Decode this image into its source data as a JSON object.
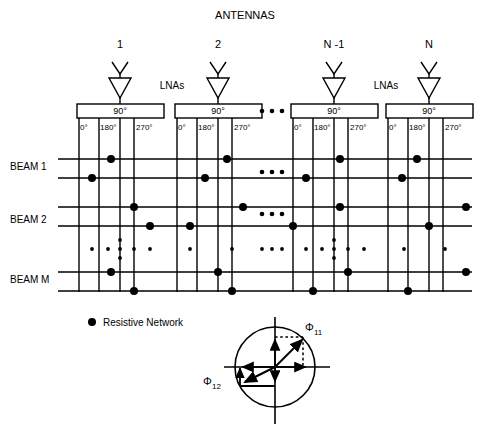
{
  "diagram": {
    "title": "ANTENNAS",
    "amplifier_label": "LNAs",
    "hybrid_label": "90°",
    "antenna_labels": [
      "1",
      "2",
      "N -1",
      "N"
    ],
    "port_labels": [
      "0°",
      "180°",
      "270°"
    ],
    "beam_labels": [
      "BEAM 1",
      "BEAM 2",
      "BEAM M"
    ],
    "legend": {
      "marker": "●",
      "text": "Resistive Network"
    },
    "ellipsis": "• • •",
    "phasor": {
      "label_1": "Φ",
      "sub_1": "11",
      "label_2": "Φ",
      "sub_2": "12"
    },
    "colors": {
      "ink": "#000000",
      "paper": "#ffffff"
    }
  }
}
